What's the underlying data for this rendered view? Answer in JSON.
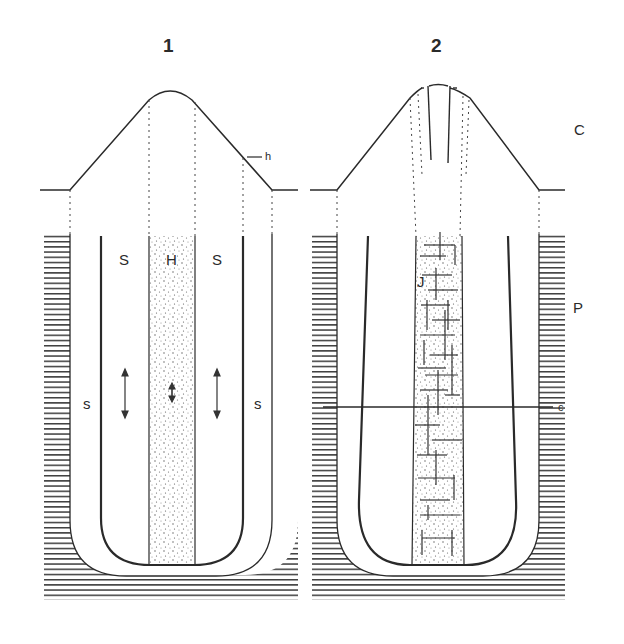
{
  "figures": [
    {
      "number": "1",
      "labels": {
        "hyaline_core": "H",
        "sheath_inner_left": "S",
        "sheath_inner_right": "S",
        "sheath_outer_left": "s",
        "sheath_outer_right": "s",
        "h_pointer": "h"
      }
    },
    {
      "number": "2",
      "labels": {
        "core": "J",
        "section_line": "c"
      }
    }
  ],
  "zones": {
    "top": "C",
    "middle": "P"
  },
  "colors": {
    "ink": "#2a2a2a",
    "background": "#ffffff"
  }
}
